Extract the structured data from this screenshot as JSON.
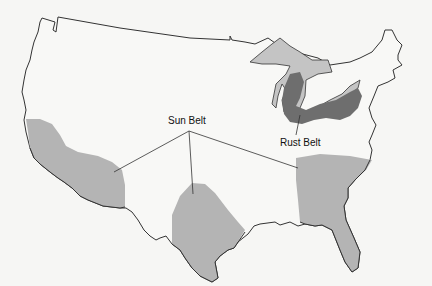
{
  "map": {
    "type": "thematic-region-map",
    "region": "United States (contiguous)",
    "colors": {
      "background": "#f6f6f4",
      "outline": "#333333",
      "sun_belt_fill": "#b4b4b4",
      "rust_belt_fill": "#6e6e6e",
      "great_lakes_fill": "#c4c4c4"
    },
    "labels": {
      "sun_belt": "Sun Belt",
      "rust_belt": "Rust Belt"
    },
    "regions": [
      {
        "name": "Sun Belt",
        "areas": [
          "Southern California / Arizona",
          "Texas",
          "Southeast / Florida"
        ]
      },
      {
        "name": "Rust Belt",
        "areas": [
          "Michigan / Ohio / Pennsylvania / Great Lakes"
        ]
      }
    ]
  }
}
